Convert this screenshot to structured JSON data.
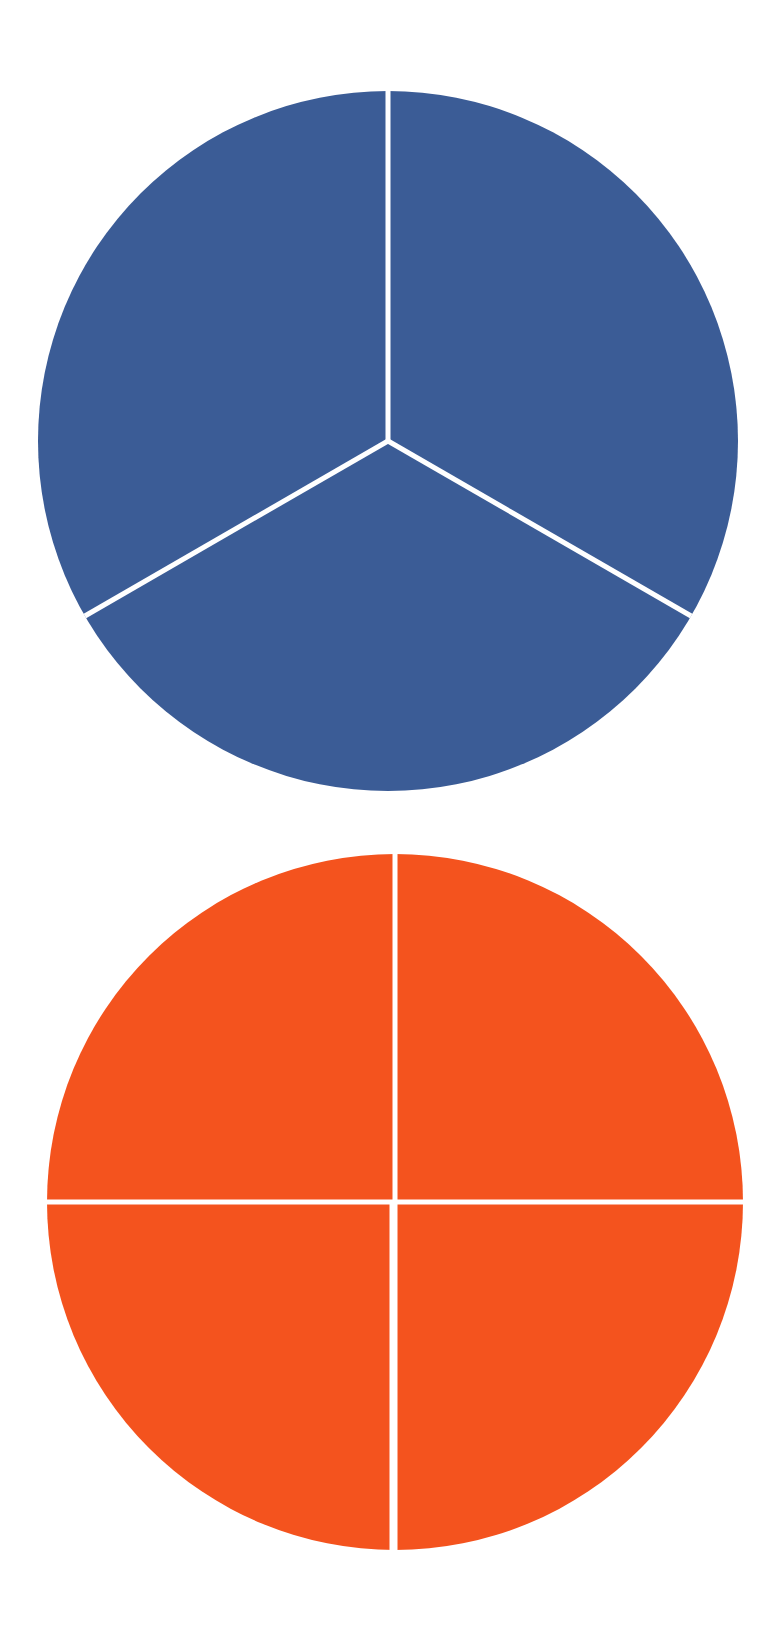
{
  "figure": {
    "background_color": "#ffffff",
    "width": 784,
    "height": 1633,
    "divider_color": "#ffffff",
    "divider_width": 5
  },
  "chart_data": [
    {
      "type": "pie",
      "name": "blue-pie-chart",
      "title": "",
      "subtitle": "",
      "xlabel": "",
      "ylabel": "",
      "legend": [],
      "annotations": [],
      "grid": false,
      "labels": [
        "Slice 1",
        "Slice 2",
        "Slice 3"
      ],
      "values": [
        1,
        1,
        1
      ],
      "percentages": [
        33.3,
        33.3,
        33.3
      ],
      "slice_angles_deg": [
        120,
        120,
        120
      ],
      "start_angle_deg": 0,
      "colors": [
        "#3b5c96",
        "#3b5c96",
        "#3b5c96"
      ],
      "fill_color": "#3b5c96",
      "edge_color": "#ffffff",
      "edge_width": 5,
      "center": [
        388,
        441
      ],
      "radius": 350
    },
    {
      "type": "pie",
      "name": "orange-pie-chart",
      "title": "",
      "subtitle": "",
      "xlabel": "",
      "ylabel": "",
      "legend": [],
      "annotations": [],
      "grid": false,
      "labels": [
        "Slice 1",
        "Slice 2",
        "Slice 3",
        "Slice 4"
      ],
      "values": [
        1,
        1,
        1,
        1
      ],
      "percentages": [
        25,
        25,
        25,
        25
      ],
      "slice_angles_deg": [
        90,
        90,
        90,
        90
      ],
      "start_angle_deg": 0,
      "colors": [
        "#f4531e",
        "#f4531e",
        "#f4531e",
        "#f4531e"
      ],
      "fill_color": "#f4531e",
      "edge_color": "#ffffff",
      "edge_width": 5,
      "center": [
        395,
        1202
      ],
      "radius": 348
    }
  ]
}
